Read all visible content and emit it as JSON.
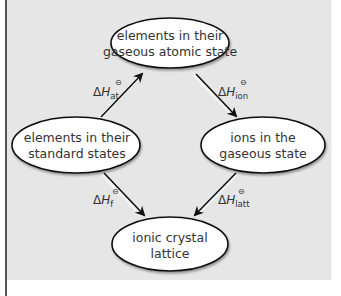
{
  "diagram": {
    "nodes": [
      {
        "id": "gaseous-atoms",
        "line1": "elements in their",
        "line2": "gaseous atomic state"
      },
      {
        "id": "standard-states",
        "line1": "elements in their",
        "line2": "standard states"
      },
      {
        "id": "gaseous-ions",
        "line1": "ions in the",
        "line2": "gaseous state"
      },
      {
        "id": "lattice",
        "line1": "ionic crystal",
        "line2": "lattice"
      }
    ],
    "edges": [
      {
        "from": "standard-states",
        "to": "gaseous-atoms",
        "delta": "Δ",
        "symbol": "H",
        "sub": "at",
        "sup": "⊖"
      },
      {
        "from": "gaseous-atoms",
        "to": "gaseous-ions",
        "delta": "Δ",
        "symbol": "H",
        "sub": "ion",
        "sup": "⊖"
      },
      {
        "from": "standard-states",
        "to": "lattice",
        "delta": "Δ",
        "symbol": "H",
        "sub": "f",
        "sup": "⊖"
      },
      {
        "from": "gaseous-ions",
        "to": "lattice",
        "delta": "Δ",
        "symbol": "H",
        "sub": "latt",
        "sup": "⊖"
      }
    ],
    "colors": {
      "background": "#e6e6e6",
      "node_fill": "#ffffff",
      "node_stroke": "#111111",
      "arrow": "#111111",
      "text": "#333333"
    }
  }
}
